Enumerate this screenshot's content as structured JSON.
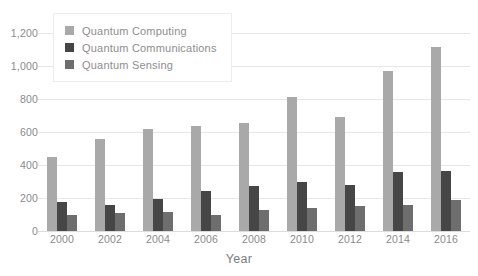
{
  "chart_data": {
    "type": "bar",
    "title": "",
    "subtitle": "",
    "xlabel": "Year",
    "ylabel": "",
    "categories": [
      "2000",
      "2002",
      "2004",
      "2006",
      "2008",
      "2010",
      "2012",
      "2014",
      "2016"
    ],
    "series": [
      {
        "name": "Quantum Computing",
        "color": "#a9a9a9",
        "values": [
          450,
          555,
          620,
          635,
          655,
          815,
          690,
          970,
          1115
        ]
      },
      {
        "name": "Quantum Communications",
        "color": "#464646",
        "values": [
          175,
          155,
          195,
          245,
          270,
          300,
          280,
          355,
          365
        ]
      },
      {
        "name": "Quantum Sensing",
        "color": "#6e6e6e",
        "values": [
          95,
          110,
          115,
          100,
          125,
          140,
          150,
          155,
          190
        ]
      }
    ],
    "ylim": [
      0,
      1200
    ],
    "y_ticks": [
      0,
      200,
      400,
      600,
      800,
      1000,
      1200
    ],
    "y_tick_labels": [
      "0",
      "200",
      "400",
      "600",
      "800",
      "1,000",
      "1,200"
    ],
    "grid": true,
    "grid_axis": "y",
    "legend_position": "top-left",
    "bar_mode": "grouped"
  },
  "colors": {
    "grid": "#e6e6e6",
    "axis_text": "#8a8a8a",
    "legend_text": "#8e8e8e",
    "background": "#ffffff"
  }
}
